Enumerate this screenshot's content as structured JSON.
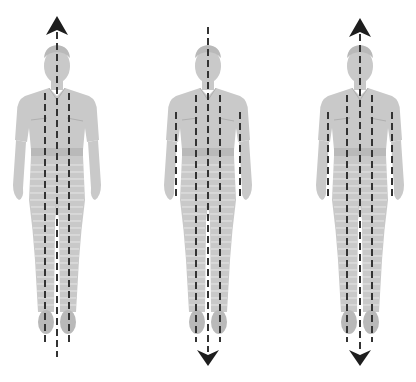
{
  "diagram": {
    "background_color": "#ffffff",
    "figure_color": "#c9c9c9",
    "line_color": "#333333",
    "arrow_color": "#1e1e1e",
    "figures": [
      {
        "id": "figure-1",
        "center_x": 57,
        "arrows": [
          "up"
        ],
        "dashed_lines": 3,
        "line_positions": [
          "left-leg",
          "center",
          "right-leg"
        ]
      },
      {
        "id": "figure-2",
        "center_x": 208,
        "arrows": [
          "down"
        ],
        "dashed_lines": 5,
        "line_positions": [
          "left-arm",
          "left-leg",
          "center",
          "right-leg",
          "right-arm"
        ]
      },
      {
        "id": "figure-3",
        "center_x": 360,
        "arrows": [
          "up",
          "down"
        ],
        "dashed_lines": 5,
        "line_positions": [
          "left-arm",
          "left-leg",
          "center",
          "right-leg",
          "right-arm"
        ]
      }
    ]
  }
}
